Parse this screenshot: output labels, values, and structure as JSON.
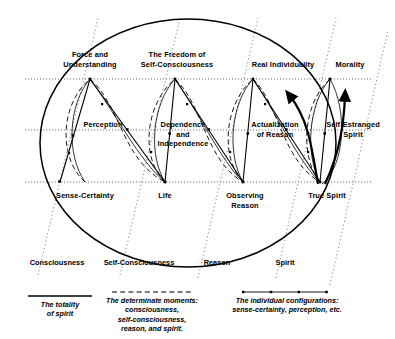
{
  "figure": {
    "background_color": "#ffffff",
    "ink_color": "#000000"
  },
  "nodes": {
    "top_row": [
      {
        "id": "force-and-understanding",
        "label": "Force and\nUnderstanding",
        "x": 90,
        "y": 79
      },
      {
        "id": "freedom-of-self-consciousness",
        "label": "The Freedom of\nSelf-Consciousness",
        "x": 175,
        "y": 79
      },
      {
        "id": "real-individuality",
        "label": "Real Individuality",
        "x": 253,
        "y": 79
      },
      {
        "id": "morality",
        "label": "Morality",
        "x": 330,
        "y": 79
      }
    ],
    "middle_row": [
      {
        "id": "perception",
        "label": "Perception",
        "x": 90,
        "y": 130
      },
      {
        "id": "dependence-and-independence",
        "label": "Dependence\nand\nIndependence",
        "x": 175,
        "y": 130
      },
      {
        "id": "actualization-of-reason",
        "label": "Actualization\nof Reason",
        "x": 253,
        "y": 130
      },
      {
        "id": "self-estranged-spirit",
        "label": "Self-Estranged\nSpirit",
        "x": 331,
        "y": 130
      }
    ],
    "bottom_row": [
      {
        "id": "sense-certainty",
        "label": "Sense-Certainty",
        "x": 85,
        "y": 182
      },
      {
        "id": "life",
        "label": "Life",
        "x": 165,
        "y": 182
      },
      {
        "id": "observing-reason",
        "label": "Observing\nReason",
        "x": 243,
        "y": 182
      },
      {
        "id": "true-spirit",
        "label": "True Spirit",
        "x": 320,
        "y": 182
      }
    ]
  },
  "bands": [
    {
      "id": "consciousness",
      "label": "Consciousness",
      "x": 57,
      "y": 262
    },
    {
      "id": "self-consciousness",
      "label": "Self-Consciousness",
      "x": 139,
      "y": 262
    },
    {
      "id": "reason",
      "label": "Reason",
      "x": 217,
      "y": 262
    },
    {
      "id": "spirit",
      "label": "Spirit",
      "x": 285,
      "y": 262
    }
  ],
  "legend": [
    {
      "id": "totality-of-spirit",
      "sample": "solid-line",
      "caption": "The totality\nof spirit",
      "x": 60,
      "line_y": 296,
      "line_x1": 28,
      "line_x2": 92,
      "text_y": 300
    },
    {
      "id": "determinate-moments",
      "sample": "dashed-line",
      "caption": "The determinate moments:\nconsciousness,\nself-consciousness,\nreason, and spirit.",
      "x": 152,
      "line_y": 292,
      "line_x1": 112,
      "line_x2": 192,
      "text_y": 296
    },
    {
      "id": "individual-configurations",
      "sample": "dotted-node-line",
      "caption": "The individual configurations:\nsense-certainty, perception, etc.",
      "x": 287,
      "line_y": 292,
      "line_x1": 243,
      "line_x2": 327,
      "text_y": 296
    }
  ],
  "guides": {
    "horizontal_dotted_y": [
      79,
      130,
      182
    ],
    "diagonal_dotted_count": 5
  },
  "arrows": [
    {
      "id": "arrow-to-real-individuality",
      "from": "true-spirit",
      "to": "real-individuality"
    },
    {
      "id": "arrow-to-morality",
      "from": "true-spirit",
      "to": "morality"
    }
  ]
}
